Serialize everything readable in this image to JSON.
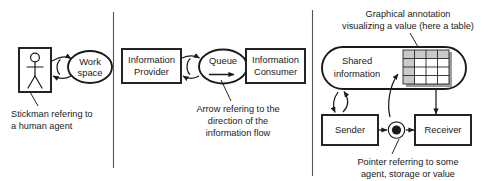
{
  "diagram": {
    "background_color": "#ffffff",
    "line_color": "#1a1a1a",
    "table_shade_color": "#c9c9c9",
    "table_shadow_color": "#9c9c9c"
  },
  "panels": [
    {
      "id": "panel-human-agent",
      "nodes": [
        {
          "id": "stickman-box",
          "label": "",
          "shape": "rectangle",
          "icon": "stickman-icon"
        },
        {
          "id": "work-space",
          "label_line1": "Work",
          "label_line2": "space",
          "shape": "ellipse"
        }
      ],
      "caption": {
        "line1": "Stickman refering to",
        "line2": "a human agent"
      }
    },
    {
      "id": "panel-information-flow",
      "nodes": [
        {
          "id": "information-provider",
          "label_line1": "Information",
          "label_line2": "Provider",
          "shape": "rectangle"
        },
        {
          "id": "queue",
          "label_line1": "Queue",
          "label_line2": "",
          "shape": "ellipse",
          "annotation": "direction-arrow"
        },
        {
          "id": "information-consumer",
          "label_line1": "Information",
          "label_line2": "Consumer",
          "shape": "rectangle"
        }
      ],
      "caption": {
        "line1": "Arrow refering to the",
        "line2": "direction of the",
        "line3": "information flow"
      }
    },
    {
      "id": "panel-shared-information",
      "nodes": [
        {
          "id": "shared-information",
          "label_line1": "Shared",
          "label_line2": "information",
          "shape": "rounded-rectangle"
        },
        {
          "id": "table-annotation",
          "shape": "table",
          "columns": 4,
          "rows": 4
        },
        {
          "id": "sender",
          "label": "Sender",
          "shape": "rectangle"
        },
        {
          "id": "receiver",
          "label": "Receiver",
          "shape": "rectangle"
        },
        {
          "id": "pointer",
          "shape": "filled-circle-in-circle"
        }
      ],
      "caption_top": {
        "line1": "Graphical annotation",
        "line2": "visualizing a value (here a table)"
      },
      "caption_bottom": {
        "line1": "Pointer referring to some",
        "line2": "agent, storage or value"
      }
    }
  ]
}
